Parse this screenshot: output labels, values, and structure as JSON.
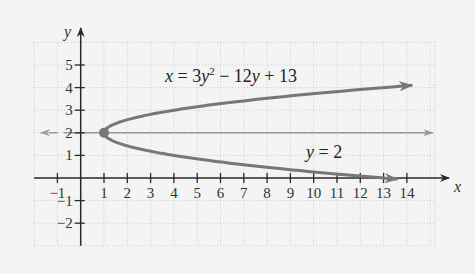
{
  "chart_data": {
    "type": "line",
    "title": "",
    "xlabel": "x",
    "ylabel": "y",
    "xlim": [
      -2,
      15.2
    ],
    "ylim": [
      -3,
      6
    ],
    "grid": true,
    "x_ticks": [
      -1,
      1,
      2,
      3,
      4,
      5,
      6,
      7,
      8,
      9,
      10,
      11,
      12,
      13,
      14
    ],
    "y_ticks": [
      -2,
      -1,
      1,
      2,
      3,
      4,
      5
    ],
    "x_tick_labels": [
      "−1",
      "1",
      "2",
      "3",
      "4",
      "5",
      "6",
      "7",
      "8",
      "9",
      "10",
      "11",
      "12",
      "13",
      "14"
    ],
    "y_tick_labels": [
      "−2",
      "−1",
      "1",
      "2",
      "3",
      "4",
      "5"
    ],
    "series": [
      {
        "name": "parabola",
        "equation": "x = 3y^2 - 12y + 13",
        "y_range": [
          -0.05,
          4.1
        ],
        "color": "#777777",
        "style": "solid",
        "arrows": "both-ends",
        "sample_points": [
          {
            "x": 14.2,
            "y": 4.1
          },
          {
            "x": 13,
            "y": 4
          },
          {
            "x": 4,
            "y": 3
          },
          {
            "x": 1,
            "y": 2
          },
          {
            "x": 4,
            "y": 1
          },
          {
            "x": 13,
            "y": 0
          },
          {
            "x": 13.6,
            "y": -0.05
          }
        ]
      },
      {
        "name": "axis of symmetry",
        "equation": "y = 2",
        "color": "#999999",
        "style": "dashed",
        "arrows": "both-ends",
        "x_range": [
          -1.7,
          15.1
        ]
      }
    ],
    "points": [
      {
        "label": "vertex",
        "x": 1,
        "y": 2,
        "color": "#777777"
      }
    ],
    "annotations": [
      {
        "text": "x = 3y² − 12y + 13",
        "x": 3.6,
        "y": 4.35
      },
      {
        "text": "y = 2",
        "x": 10,
        "y": 1.1
      }
    ]
  },
  "labels": {
    "x_axis": "x",
    "y_axis": "y",
    "equation_main": {
      "lhs": "x",
      "eq": " = 3",
      "var1": "y",
      "sup": "2",
      "mid": " − 12",
      "var2": "y",
      "tail": " + 13"
    },
    "equation_line": {
      "var": "y",
      "rest": " = 2"
    }
  },
  "colors": {
    "background": "#f4f4f4",
    "curve": "#777777",
    "dashed": "#999999",
    "axis": "#2a2a2a",
    "grid": "#c9c9c9"
  }
}
